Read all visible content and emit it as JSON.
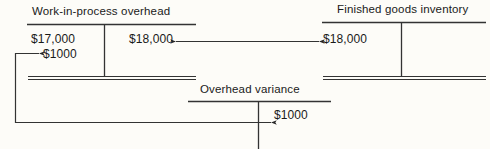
{
  "diagram": {
    "type": "t-account-flow",
    "background_color": "#fdfcf8",
    "ink_color": "#262626",
    "accounts": [
      {
        "id": "work-in-process-overhead",
        "title": "Work-in-process overhead",
        "debit_entries": [
          "$17,000",
          "$1000"
        ],
        "credit_entries": [
          "$18,000"
        ],
        "closed": true
      },
      {
        "id": "finished-goods-inventory",
        "title": "Finished goods inventory",
        "debit_entries": [
          "$18,000"
        ],
        "credit_entries": [],
        "closed": true
      },
      {
        "id": "overhead-variance",
        "title": "Overhead variance",
        "debit_entries": [],
        "credit_entries": [
          "$1000"
        ],
        "closed": false
      }
    ],
    "flows": [
      {
        "id": "cost-of-goods-transfer",
        "amount": "$18,000",
        "from": "work-in-process-overhead",
        "to": "finished-goods-inventory",
        "arrowheads": "both"
      },
      {
        "id": "variance-transfer",
        "amount": "$1000",
        "from": "overhead-variance",
        "to": "work-in-process-overhead",
        "arrowheads": "both"
      }
    ]
  }
}
